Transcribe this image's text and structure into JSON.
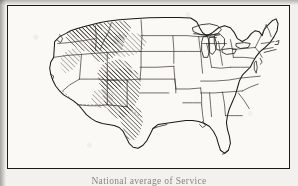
{
  "figure": {
    "kind": "scanned-halftone-map",
    "caption": "National average of Service",
    "caption_visibility": "clipped by bottom edge of page",
    "frame": {
      "present": true,
      "style": "single printed rule",
      "color": "#1c1a17"
    },
    "colors": {
      "paper": "#f2f1ee",
      "map_field": "#faf9f6",
      "ink": "#1c1a17",
      "state_line": "#3a362f",
      "hatch": "#23201b"
    }
  },
  "legend": {
    "shading_meaning": "hatched region",
    "hatch_angle_degrees": 45,
    "hatch_direction": "lower-left to upper-right"
  },
  "regions": [
    {
      "name": "Pacific Northwest interior",
      "shaded": true,
      "note": "heavy hatching across northern Washington, Idaho panhandle and western Montana"
    },
    {
      "name": "Northern Rockies",
      "shaded": true,
      "note": "hatched band through Montana and Wyoming"
    },
    {
      "name": "Great Basin east rim",
      "shaded": true,
      "note": "hatching along eastern Nevada and Utah"
    },
    {
      "name": "Southern Rockies",
      "shaded": true,
      "note": "dense hatching over Colorado and New Mexico"
    },
    {
      "name": "West Texas",
      "shaded": true,
      "note": "hatching tapering into the Texas panhandle and Big Bend"
    },
    {
      "name": "California coastal",
      "shaded": false,
      "note": "left clear"
    },
    {
      "name": "Great Plains",
      "shaded": false,
      "note": "Dakotas, Nebraska, Kansas, Oklahoma clear"
    },
    {
      "name": "Midwest",
      "shaded": false,
      "note": "Great Lakes states left clear"
    },
    {
      "name": "Northeast",
      "shaded": false,
      "note": "New England and Mid-Atlantic left clear"
    },
    {
      "name": "Southeast",
      "shaded": false,
      "note": "Gulf and South Atlantic states left clear"
    }
  ],
  "features": {
    "great_lakes": true,
    "florida_peninsula": true,
    "gulf_coast": true,
    "puget_sound": true,
    "chesapeake_bay": true,
    "cape_cod": true
  }
}
